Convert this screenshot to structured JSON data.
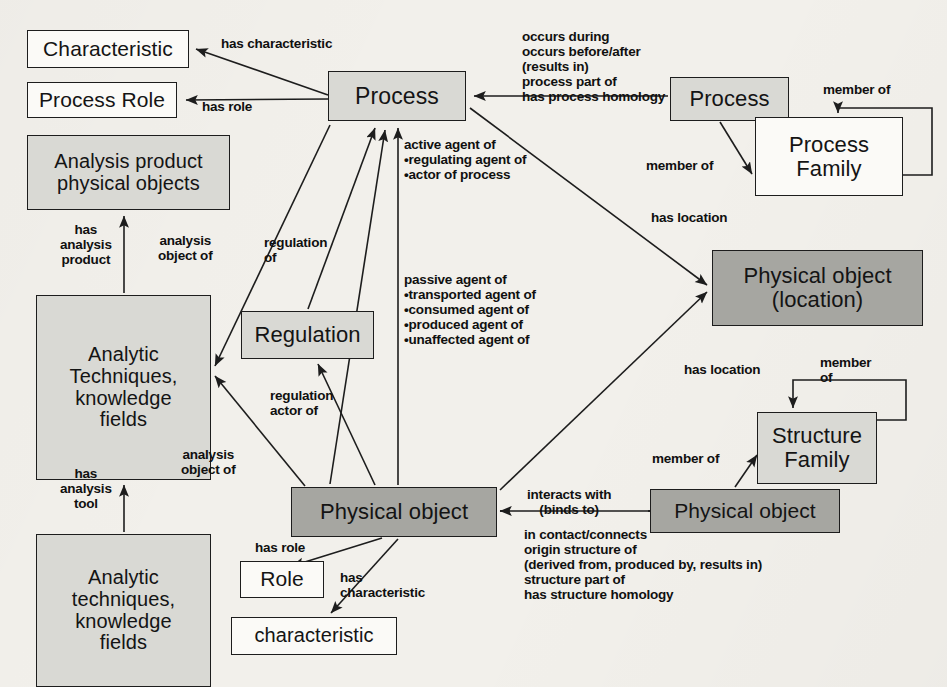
{
  "diagram": {
    "colors": {
      "node_white": "#fbfaf7",
      "node_light_gray": "#d9d9d4",
      "node_dark_gray": "#a6a6a1",
      "stroke": "#1d1d1d",
      "text": "#141414",
      "background": "#f2f0eb"
    }
  },
  "nodes": [
    {
      "id": "characteristic_top",
      "label": "Characteristic",
      "x": 27,
      "y": 30,
      "w": 162,
      "h": 38,
      "fill": "white",
      "font": 21
    },
    {
      "id": "process_role",
      "label": "Process Role",
      "x": 27,
      "y": 82,
      "w": 150,
      "h": 36,
      "fill": "white",
      "font": 21
    },
    {
      "id": "analysis_product",
      "label": "Analysis product\nphysical objects",
      "x": 27,
      "y": 135,
      "w": 203,
      "h": 75,
      "fill": "light",
      "font": 20
    },
    {
      "id": "analytic_upper",
      "label": "Analytic\nTechniques,\nknowledge\nfields",
      "x": 36,
      "y": 295,
      "w": 175,
      "h": 185,
      "fill": "light",
      "font": 20
    },
    {
      "id": "analytic_lower",
      "label": "Analytic\ntechniques,\nknowledge\nfields",
      "x": 36,
      "y": 534,
      "w": 175,
      "h": 153,
      "fill": "light",
      "font": 20
    },
    {
      "id": "regulation",
      "label": "Regulation",
      "x": 241,
      "y": 311,
      "w": 133,
      "h": 48,
      "fill": "light",
      "font": 22
    },
    {
      "id": "process_main",
      "label": "Process",
      "x": 328,
      "y": 71,
      "w": 138,
      "h": 50,
      "fill": "light",
      "font": 23
    },
    {
      "id": "process_right",
      "label": "Process",
      "x": 670,
      "y": 77,
      "w": 119,
      "h": 44,
      "fill": "light",
      "font": 22
    },
    {
      "id": "process_family",
      "label": "Process\nFamily",
      "x": 755,
      "y": 117,
      "w": 148,
      "h": 79,
      "fill": "white",
      "font": 22
    },
    {
      "id": "physical_location",
      "label": "Physical object\n(location)",
      "x": 712,
      "y": 250,
      "w": 211,
      "h": 76,
      "fill": "dark",
      "font": 22
    },
    {
      "id": "structure_family",
      "label": "Structure\nFamily",
      "x": 757,
      "y": 412,
      "w": 120,
      "h": 72,
      "fill": "light",
      "font": 22
    },
    {
      "id": "physical_main",
      "label": "Physical object",
      "x": 291,
      "y": 487,
      "w": 206,
      "h": 50,
      "fill": "dark",
      "font": 22
    },
    {
      "id": "physical_right",
      "label": "Physical object",
      "x": 650,
      "y": 489,
      "w": 190,
      "h": 44,
      "fill": "dark",
      "font": 21
    },
    {
      "id": "role",
      "label": "Role",
      "x": 240,
      "y": 561,
      "w": 84,
      "h": 37,
      "fill": "white",
      "font": 21
    },
    {
      "id": "characteristic_bot",
      "label": "characteristic",
      "x": 231,
      "y": 617,
      "w": 166,
      "h": 38,
      "fill": "white",
      "font": 20
    }
  ],
  "edge_labels": [
    {
      "id": "has-characteristic",
      "text": "has characteristic",
      "x": 221,
      "y": 36,
      "align": "left"
    },
    {
      "id": "has-role",
      "text": "has role",
      "x": 202,
      "y": 99,
      "align": "left"
    },
    {
      "id": "occurs-group",
      "text": "occurs during\noccurs before/after\n(results in)\nprocess part of\nhas process homology",
      "x": 522,
      "y": 29,
      "align": "left"
    },
    {
      "id": "member-of-proc-top",
      "text": "member of",
      "x": 823,
      "y": 82,
      "align": "left"
    },
    {
      "id": "member-of-proc",
      "text": "member of",
      "x": 646,
      "y": 158,
      "align": "left"
    },
    {
      "id": "active-agent-group",
      "text": "active agent of\n•regulating agent of\n•actor of process",
      "x": 404,
      "y": 137,
      "align": "left"
    },
    {
      "id": "passive-agent-group",
      "text": "passive agent of\n•transported agent of\n•consumed agent of\n•produced agent of\n•unaffected agent of",
      "x": 404,
      "y": 272,
      "align": "left"
    },
    {
      "id": "has-location-top",
      "text": "has location",
      "x": 651,
      "y": 210,
      "align": "left"
    },
    {
      "id": "has-analysis-product",
      "text": "has\nanalysis\nproduct",
      "x": 60,
      "y": 222,
      "align": "center"
    },
    {
      "id": "analysis-object-of-1",
      "text": "analysis\nobject of",
      "x": 158,
      "y": 233,
      "align": "center"
    },
    {
      "id": "regulation-of",
      "text": "regulation\nof",
      "x": 264,
      "y": 235,
      "align": "left"
    },
    {
      "id": "regulation-actor-of",
      "text": "regulation\nactor of",
      "x": 270,
      "y": 388,
      "align": "left"
    },
    {
      "id": "analysis-object-of-2",
      "text": "analysis\nobject of",
      "x": 181,
      "y": 447,
      "align": "center"
    },
    {
      "id": "has-analysis-tool",
      "text": "has\nanalysis\ntool",
      "x": 60,
      "y": 466,
      "align": "center"
    },
    {
      "id": "has-location-bottom",
      "text": "has location",
      "x": 684,
      "y": 362,
      "align": "left"
    },
    {
      "id": "member-of-struct-top",
      "text": "member\nof",
      "x": 820,
      "y": 355,
      "align": "left"
    },
    {
      "id": "member-of-struct",
      "text": "member of",
      "x": 652,
      "y": 451,
      "align": "left"
    },
    {
      "id": "interacts-group",
      "text": "interacts with\n(binds to)",
      "x": 527,
      "y": 487,
      "align": "center"
    },
    {
      "id": "structure-group",
      "text": "in contact/connects\norigin structure of\n     (derived from, produced by, results in)\nstructure part of\nhas structure homology",
      "x": 524,
      "y": 527,
      "align": "left"
    },
    {
      "id": "has-role-bottom",
      "text": "has role",
      "x": 255,
      "y": 540,
      "align": "left"
    },
    {
      "id": "has-characteristic-b",
      "text": "has\ncharacteristic",
      "x": 340,
      "y": 570,
      "align": "left"
    }
  ],
  "edges": [
    {
      "id": "process-to-characteristic",
      "from": "process_main",
      "to": "characteristic_top",
      "label": "has characteristic"
    },
    {
      "id": "process-to-process-role",
      "from": "process_main",
      "to": "process_role",
      "label": "has role"
    },
    {
      "id": "process-to-process",
      "from": "process_right",
      "to": "process_main",
      "label": "occurs during / occurs before/after / (results in) / process part of / has process homology"
    },
    {
      "id": "process-to-process-family",
      "from": "process_right",
      "to": "process_family",
      "label": "member of"
    },
    {
      "id": "process-family-self-loop",
      "from": "process_family",
      "to": "process_family",
      "label": "member of"
    },
    {
      "id": "process-to-location",
      "from": "process_main",
      "to": "physical_location",
      "label": "has location"
    },
    {
      "id": "physical-to-process-active",
      "from": "physical_main",
      "to": "process_main",
      "label": "active agent of / regulating agent of / actor of process"
    },
    {
      "id": "physical-to-process-passive",
      "from": "physical_main",
      "to": "process_main",
      "label": "passive agent of / transported agent of / consumed agent of / produced agent of / unaffected agent of"
    },
    {
      "id": "physical-to-location",
      "from": "physical_main",
      "to": "physical_location",
      "label": "has location"
    },
    {
      "id": "analytic-to-analysis-prod",
      "from": "analytic_upper",
      "to": "analysis_product",
      "label": "has analysis product"
    },
    {
      "id": "process-to-analytic",
      "from": "process_main",
      "to": "analytic_upper",
      "label": "analysis object of"
    },
    {
      "id": "regulation-to-process",
      "from": "regulation",
      "to": "process_main",
      "label": "regulation of"
    },
    {
      "id": "physical-to-regulation",
      "from": "physical_main",
      "to": "regulation",
      "label": "regulation actor of"
    },
    {
      "id": "physical-to-analytic",
      "from": "physical_main",
      "to": "analytic_upper",
      "label": "analysis object of"
    },
    {
      "id": "analytic-lower-to-upper",
      "from": "analytic_lower",
      "to": "analytic_upper",
      "label": "has analysis tool"
    },
    {
      "id": "physical-interacts",
      "from": "physical_main",
      "to": "physical_right",
      "label": "interacts with (binds to)"
    },
    {
      "id": "physical-right-to-struct",
      "from": "physical_right",
      "to": "structure_family",
      "label": "member of"
    },
    {
      "id": "structure-family-self-loop",
      "from": "structure_family",
      "to": "structure_family",
      "label": "member of"
    },
    {
      "id": "physical-to-role",
      "from": "physical_main",
      "to": "role",
      "label": "has role"
    },
    {
      "id": "physical-to-characteristic",
      "from": "physical_main",
      "to": "characteristic_bot",
      "label": "has characteristic"
    }
  ]
}
